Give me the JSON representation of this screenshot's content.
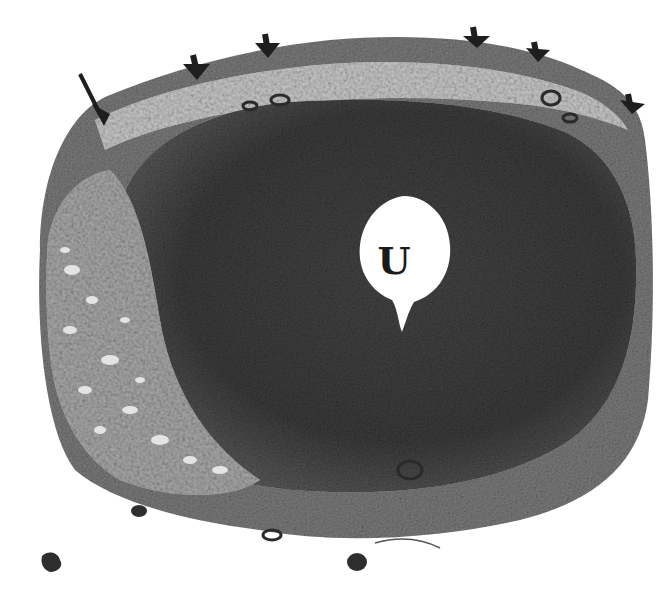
{
  "figure": {
    "type": "histology-micrograph",
    "stain": "grayscale",
    "labels": [
      {
        "id": "lumen",
        "text": "U"
      }
    ],
    "annotations": {
      "long_arrow_count": 1,
      "short_arrowhead_count": 5
    },
    "colors": {
      "background": "#ffffff",
      "tissue_dark": "#3a3a3a",
      "tissue_mid": "#6e6e6e",
      "tissue_light": "#a8a8a8",
      "lumen": "#ffffff",
      "arrow": "#1e1e1e"
    }
  }
}
